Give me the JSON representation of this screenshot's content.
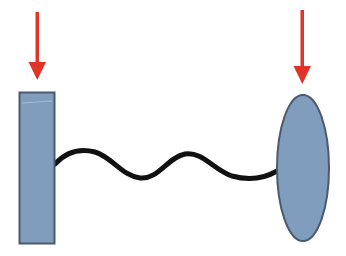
{
  "diagram": {
    "title": "",
    "colors": {
      "background": "#ffffff",
      "body_fill": "#809dbd",
      "body_stroke": "#4b5a70",
      "arrow": "#e03428",
      "spring": "#111111"
    },
    "elements": {
      "left_block": {
        "label": "",
        "shape": "rectangle",
        "x": 19,
        "y": 92,
        "width": 36,
        "height": 152
      },
      "right_body": {
        "label": "",
        "shape": "ellipse",
        "cx": 303,
        "cy": 168,
        "rx": 26,
        "ry": 73
      },
      "spring": {
        "label": "",
        "shape": "wavy-line",
        "from": [
          55,
          164
        ],
        "to": [
          277,
          171
        ]
      },
      "left_arrow": {
        "label": "",
        "direction": "down",
        "x": 37,
        "y_start": 12,
        "y_end": 80
      },
      "right_arrow": {
        "label": "",
        "direction": "down",
        "x": 302,
        "y_start": 10,
        "y_end": 84
      }
    }
  }
}
